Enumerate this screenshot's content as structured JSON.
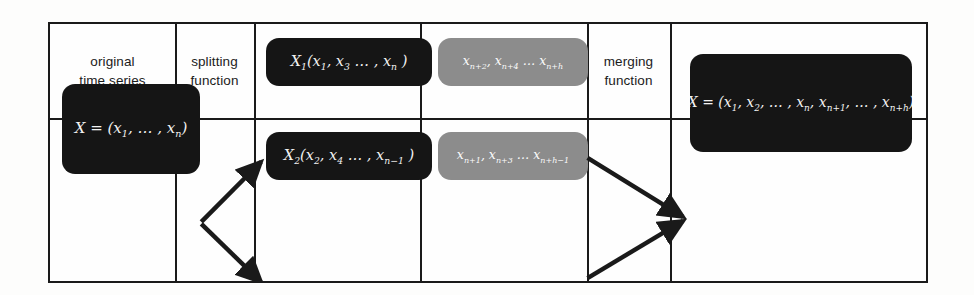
{
  "figure": {
    "type": "pipeline-diagram"
  },
  "table": {
    "columns": [
      {
        "id": "original-time-series",
        "label": "original\ntime series"
      },
      {
        "id": "splitting-function",
        "label": "splitting\nfunction"
      },
      {
        "id": "subseries",
        "label": "subseries"
      },
      {
        "id": "prediction",
        "label": "prediction"
      },
      {
        "id": "merging-function",
        "label": "merging\nfunction"
      },
      {
        "id": "result",
        "label": "result"
      }
    ]
  },
  "nodes": {
    "original": {
      "id": "original-series-node",
      "style": "dark",
      "text": "X = (x1, …, xn)",
      "parts": [
        {
          "t": "X = (x"
        },
        {
          "sub": "1"
        },
        {
          "t": ", … , x"
        },
        {
          "sub": "n"
        },
        {
          "t": ")"
        }
      ]
    },
    "subseries_1": {
      "id": "subseries-1-node",
      "style": "dark",
      "text": "X1(x1, x3 …, xn )",
      "parts": [
        {
          "t": "X"
        },
        {
          "sub": "1"
        },
        {
          "t": "(x"
        },
        {
          "sub": "1"
        },
        {
          "t": ", x"
        },
        {
          "sub": "3"
        },
        {
          "t": " … , x"
        },
        {
          "sub": "n"
        },
        {
          "t": " )"
        }
      ]
    },
    "subseries_2": {
      "id": "subseries-2-node",
      "style": "dark",
      "text": "X2(x2, x4 …, xn−1 )",
      "parts": [
        {
          "t": "X"
        },
        {
          "sub": "2"
        },
        {
          "t": "(x"
        },
        {
          "sub": "2"
        },
        {
          "t": ", x"
        },
        {
          "sub": "4"
        },
        {
          "t": " … , x"
        },
        {
          "sub": "n−1"
        },
        {
          "t": " )"
        }
      ]
    },
    "prediction_1": {
      "id": "prediction-1-node",
      "style": "gray",
      "text": "xn+2, xn+4 … xn+h",
      "parts": [
        {
          "t": "x"
        },
        {
          "sub": "n+2"
        },
        {
          "t": ", x"
        },
        {
          "sub": "n+4"
        },
        {
          "t": " … x"
        },
        {
          "sub": "n+h"
        }
      ]
    },
    "prediction_2": {
      "id": "prediction-2-node",
      "style": "gray",
      "text": "xn+1, xn+3 … xn+h−1",
      "parts": [
        {
          "t": "x"
        },
        {
          "sub": "n+1"
        },
        {
          "t": ", x"
        },
        {
          "sub": "n+3"
        },
        {
          "t": " … x"
        },
        {
          "sub": "n+h−1"
        }
      ]
    },
    "result": {
      "id": "result-node",
      "style": "dark",
      "text": "X = (x1, x2, …, xn, xn+1, …, xn+h)",
      "parts": [
        {
          "t": "X = (x"
        },
        {
          "sub": "1"
        },
        {
          "t": ", x"
        },
        {
          "sub": "2"
        },
        {
          "t": ", … , x"
        },
        {
          "sub": "n"
        },
        {
          "t": ", x"
        },
        {
          "sub": "n+1"
        },
        {
          "t": ", … , x"
        },
        {
          "sub": "n+h"
        },
        {
          "t": ")"
        }
      ]
    }
  },
  "arrows": [
    {
      "id": "split-arrow-upper",
      "from": "original-series-node",
      "to": "subseries-1-node"
    },
    {
      "id": "split-arrow-lower",
      "from": "original-series-node",
      "to": "subseries-2-node"
    },
    {
      "id": "merge-arrow-upper",
      "from": "prediction-1-node",
      "to": "result-node"
    },
    {
      "id": "merge-arrow-lower",
      "from": "prediction-2-node",
      "to": "result-node"
    }
  ],
  "colors": {
    "dark_box": "#151515",
    "gray_box": "#8c8c8c",
    "rule": "#1a1a1a",
    "page": "#fdfdfc",
    "box_text": "#f2f2f2"
  }
}
